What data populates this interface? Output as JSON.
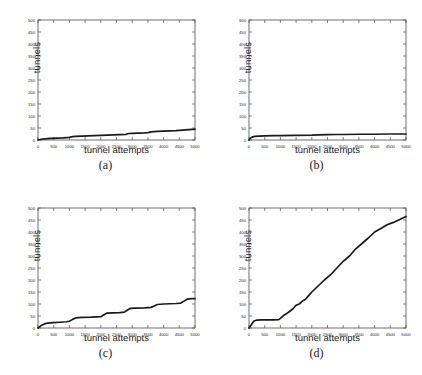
{
  "figure": {
    "layout": "2x2 grid of line plots",
    "panels": [
      {
        "id": "a",
        "caption": "(a)",
        "ylabel": "tunnels",
        "xlabel": "tunnel attempts"
      },
      {
        "id": "b",
        "caption": "(b)",
        "ylabel": "tunnels",
        "xlabel": "tunnel attempts"
      },
      {
        "id": "c",
        "caption": "(c)",
        "ylabel": "tunnels",
        "xlabel": "tunnel attempts"
      },
      {
        "id": "d",
        "caption": "(d)",
        "ylabel": "tunnels",
        "xlabel": "tunnel attempts"
      }
    ]
  },
  "axis": {
    "xticks": [
      "0",
      "500",
      "1000",
      "1500",
      "2000",
      "2500",
      "3000",
      "3500",
      "4000",
      "4500",
      "5000"
    ],
    "yticks": [
      "0",
      "50",
      "100",
      "150",
      "200",
      "250",
      "300",
      "350",
      "400",
      "450",
      "500"
    ],
    "xlim": [
      0,
      5000
    ],
    "ylim": [
      0,
      500
    ],
    "line_color": "#1a1a1a",
    "axis_color": "#4d4d4d"
  },
  "chart_data": [
    {
      "type": "line",
      "panel": "a",
      "title": "(a)",
      "xlabel": "tunnel attempts",
      "ylabel": "tunnels",
      "xlim": [
        0,
        5000
      ],
      "ylim": [
        0,
        500
      ],
      "grid": false,
      "legend": "none",
      "x": [
        0,
        100,
        200,
        400,
        600,
        800,
        900,
        1000,
        1100,
        1200,
        1400,
        1600,
        1800,
        2000,
        2200,
        2400,
        2600,
        2800,
        2850,
        2900,
        3000,
        3200,
        3400,
        3500,
        3600,
        3700,
        3800,
        4000,
        4200,
        4400,
        4600,
        4800,
        5000
      ],
      "y": [
        0,
        3,
        5,
        7,
        8,
        9,
        10,
        11,
        14,
        15,
        16,
        17,
        18,
        19,
        20,
        21,
        22,
        23,
        26,
        27,
        28,
        29,
        30,
        31,
        34,
        35,
        36,
        37,
        38,
        39,
        41,
        43,
        45
      ]
    },
    {
      "type": "line",
      "panel": "b",
      "title": "(b)",
      "xlabel": "tunnel attempts",
      "ylabel": "tunnels",
      "xlim": [
        0,
        5000
      ],
      "ylim": [
        0,
        500
      ],
      "grid": false,
      "legend": "none",
      "x": [
        0,
        50,
        100,
        150,
        200,
        300,
        500,
        800,
        1000,
        1500,
        2000,
        2200,
        2500,
        2800,
        3000,
        3500,
        4000,
        4500,
        5000
      ],
      "y": [
        0,
        8,
        12,
        14,
        15,
        16,
        17,
        18,
        18,
        19,
        20,
        21,
        22,
        23,
        23,
        24,
        24,
        25,
        25
      ]
    },
    {
      "type": "line",
      "panel": "c",
      "title": "(c)",
      "xlabel": "tunnel attempts",
      "ylabel": "tunnels",
      "xlim": [
        0,
        5000
      ],
      "ylim": [
        0,
        500
      ],
      "grid": false,
      "legend": "none",
      "x": [
        0,
        100,
        200,
        300,
        500,
        700,
        900,
        1000,
        1100,
        1200,
        1400,
        1700,
        2000,
        2100,
        2200,
        2400,
        2600,
        2750,
        2850,
        2950,
        3100,
        3400,
        3600,
        3700,
        3800,
        4000,
        4200,
        4400,
        4550,
        4650,
        4750,
        4900,
        5000
      ],
      "y": [
        0,
        10,
        17,
        20,
        22,
        24,
        26,
        28,
        36,
        42,
        44,
        45,
        47,
        55,
        62,
        63,
        64,
        66,
        75,
        82,
        83,
        84,
        86,
        92,
        98,
        100,
        101,
        102,
        104,
        112,
        120,
        122,
        122
      ]
    },
    {
      "type": "line",
      "panel": "d",
      "title": "(d)",
      "xlabel": "tunnel attempts",
      "ylabel": "tunnels",
      "xlim": [
        0,
        5000
      ],
      "ylim": [
        0,
        500
      ],
      "grid": false,
      "legend": "none",
      "x": [
        0,
        80,
        150,
        250,
        400,
        600,
        800,
        950,
        1000,
        1100,
        1200,
        1300,
        1400,
        1500,
        1600,
        1700,
        1800,
        1900,
        2000,
        2200,
        2400,
        2600,
        2800,
        3000,
        3200,
        3400,
        3600,
        3800,
        4000,
        4200,
        4400,
        4600,
        4800,
        5000
      ],
      "y": [
        0,
        15,
        28,
        33,
        34,
        34,
        34,
        35,
        40,
        52,
        60,
        70,
        80,
        95,
        100,
        112,
        120,
        135,
        150,
        175,
        200,
        222,
        250,
        278,
        300,
        330,
        352,
        375,
        400,
        415,
        430,
        440,
        452,
        465
      ]
    }
  ]
}
